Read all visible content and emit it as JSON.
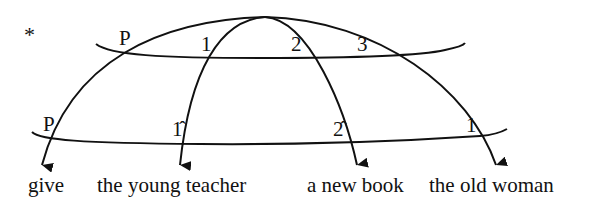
{
  "diagram": {
    "marker": "*",
    "upper_tier": {
      "labels": [
        "P",
        "1",
        "2",
        "3"
      ]
    },
    "lower_tier": {
      "labels": [
        "P",
        "1̂",
        "2̂",
        "1"
      ]
    },
    "words": [
      "give",
      "the young teacher",
      "a new book",
      "the old woman"
    ],
    "colors": {
      "ink": "#111111",
      "background": "#ffffff"
    }
  }
}
